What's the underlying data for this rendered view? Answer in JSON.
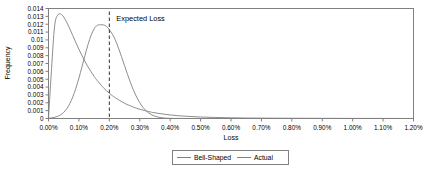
{
  "chart_data": {
    "type": "line",
    "title": "",
    "xlabel": "Loss",
    "ylabel": "Frequency",
    "xlim": [
      0,
      1.2
    ],
    "ylim": [
      0,
      0.014
    ],
    "grid": false,
    "legend_position": "bottom-center",
    "x_tick_labels": [
      "0.00%",
      "0.10%",
      "0.20%",
      "0.30%",
      "0.40%",
      "0.50%",
      "0.60%",
      "0.70%",
      "0.80%",
      "0.90%",
      "1.00%",
      "1.10%",
      "1.20%"
    ],
    "x_tick_values": [
      0.0,
      0.1,
      0.2,
      0.3,
      0.4,
      0.5,
      0.6,
      0.7,
      0.8,
      0.9,
      1.0,
      1.1,
      1.2
    ],
    "y_tick_labels": [
      "0",
      "0.001",
      "0.002",
      "0.003",
      "0.004",
      "0.005",
      "0.006",
      "0.007",
      "0.008",
      "0.009",
      "0.01",
      "0.011",
      "0.012",
      "0.013",
      "0.014"
    ],
    "y_tick_values": [
      0,
      0.001,
      0.002,
      0.003,
      0.004,
      0.005,
      0.006,
      0.007,
      0.008,
      0.009,
      0.01,
      0.011,
      0.012,
      0.013,
      0.014
    ],
    "annotations": [
      {
        "label": "Expected Loss",
        "type": "vertical-dashed-line",
        "x": 0.2
      }
    ],
    "series": [
      {
        "name": "Bell-Shaped",
        "color": "#808080",
        "style": "solid",
        "x": [
          0.0,
          0.01,
          0.02,
          0.03,
          0.04,
          0.05,
          0.06,
          0.07,
          0.08,
          0.09,
          0.1,
          0.11,
          0.12,
          0.13,
          0.14,
          0.15,
          0.16,
          0.17,
          0.18,
          0.19,
          0.2,
          0.21,
          0.22,
          0.23,
          0.24,
          0.25,
          0.26,
          0.27,
          0.28,
          0.29,
          0.3,
          0.31,
          0.32,
          0.33,
          0.34,
          0.35,
          0.36,
          0.37,
          0.38,
          0.39,
          0.4,
          0.42,
          0.44,
          0.46,
          0.5,
          0.6,
          0.8,
          1.0,
          1.2
        ],
        "values": [
          4e-05,
          8e-05,
          0.00015,
          0.00027,
          0.00047,
          0.00078,
          0.00124,
          0.00189,
          0.00276,
          0.00385,
          0.00514,
          0.00657,
          0.00804,
          0.00942,
          0.01058,
          0.01141,
          0.01186,
          0.01192,
          0.01192,
          0.01175,
          0.01131,
          0.01072,
          0.00998,
          0.00896,
          0.00787,
          0.00672,
          0.00559,
          0.00452,
          0.00355,
          0.00271,
          0.00201,
          0.00145,
          0.00101,
          0.00069,
          0.00045,
          0.00029,
          0.00018,
          0.00011,
          6e-05,
          3e-05,
          2e-05,
          1e-05,
          5e-06,
          2e-06,
          0.0,
          0.0,
          0.0,
          0.0,
          0.0
        ]
      },
      {
        "name": "Actual",
        "color": "#808080",
        "style": "solid",
        "x": [
          0.0,
          0.01,
          0.02,
          0.03,
          0.04,
          0.05,
          0.06,
          0.07,
          0.08,
          0.09,
          0.1,
          0.11,
          0.12,
          0.13,
          0.14,
          0.15,
          0.16,
          0.18,
          0.2,
          0.22,
          0.25,
          0.28,
          0.3,
          0.33,
          0.35,
          0.4,
          0.45,
          0.5,
          0.55,
          0.6,
          0.65,
          0.7,
          0.8,
          0.9,
          1.0,
          1.1,
          1.2
        ],
        "values": [
          0.0,
          0.00635,
          0.01175,
          0.01315,
          0.01329,
          0.01292,
          0.01224,
          0.01142,
          0.01054,
          0.00966,
          0.00881,
          0.00801,
          0.00726,
          0.00657,
          0.00594,
          0.00536,
          0.00484,
          0.00394,
          0.00322,
          0.00263,
          0.00194,
          0.00144,
          0.00118,
          0.00088,
          0.00072,
          0.00045,
          0.00029,
          0.00019,
          0.00013,
          9e-05,
          6e-05,
          5e-05,
          3e-05,
          2e-05,
          1e-05,
          1e-05,
          0.0
        ]
      }
    ]
  },
  "legend": {
    "items": [
      {
        "label": "Bell-Shaped"
      },
      {
        "label": "Actual"
      }
    ]
  },
  "colors": {
    "series_line": "#808080",
    "frame": "#808080",
    "text": "#000000",
    "annotation_line": "#333333"
  }
}
